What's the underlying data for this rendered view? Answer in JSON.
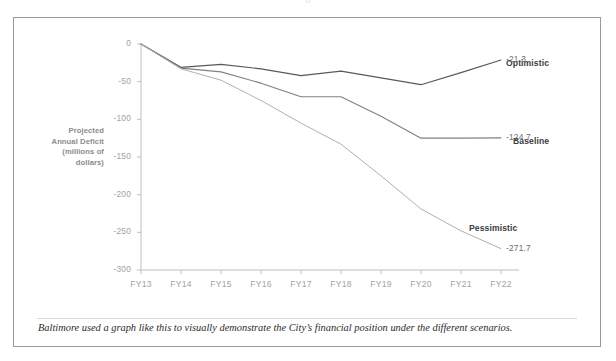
{
  "figure": {
    "caption": "Baltimore used a graph like this to visually demonstrate the City’s financial position under the different scenarios.",
    "clipped_top_text": "y"
  },
  "colors": {
    "frame_border": "#9a9a9a",
    "axis_gray": "#bfbfbf",
    "tick_text": "#a2a2a2",
    "label_text": "#3c3c3c",
    "optimistic": "#595959",
    "baseline": "#808080",
    "pessimistic": "#b0b0b0"
  },
  "chart_data": {
    "type": "line",
    "title": "",
    "xlabel": "",
    "ylabel": "Projected Annual Deficit (millions of dollars)",
    "ylabel_lines": [
      "Projected",
      "Annual Deficit",
      "(millions of",
      "dollars)"
    ],
    "categories": [
      "FY13",
      "FY14",
      "FY15",
      "FY16",
      "FY17",
      "FY18",
      "FY19",
      "FY20",
      "FY21",
      "FY22"
    ],
    "ylim": [
      -300,
      0
    ],
    "yticks": [
      0,
      -50,
      -100,
      -150,
      -200,
      -250,
      -300
    ],
    "ytick_labels": [
      "0",
      "-50",
      "-100",
      "-150",
      "-200",
      "-250",
      "-300"
    ],
    "grid": false,
    "legend": "none",
    "annotations_inline": true,
    "series": [
      {
        "name": "Optimistic",
        "color": "#595959",
        "values": [
          0,
          -31,
          -27,
          -33,
          -42,
          -36,
          -45,
          -54,
          -38,
          -21.3
        ],
        "end_label": "-21.3",
        "label_x_px": 492,
        "label_y_px": 40
      },
      {
        "name": "Baseline",
        "color": "#808080",
        "values": [
          0,
          -32,
          -37,
          -52,
          -70,
          -70,
          -96,
          -125,
          -125,
          -124.7
        ],
        "end_label": "-124.7",
        "label_x_px": 499,
        "label_y_px": 118
      },
      {
        "name": "Pessimistic",
        "color": "#b0b0b0",
        "values": [
          0,
          -33,
          -48,
          -75,
          -105,
          -133,
          -175,
          -219,
          -248,
          -271.7
        ],
        "end_label": "-271.7",
        "label_x_px": 455,
        "label_y_px": 205
      }
    ]
  }
}
